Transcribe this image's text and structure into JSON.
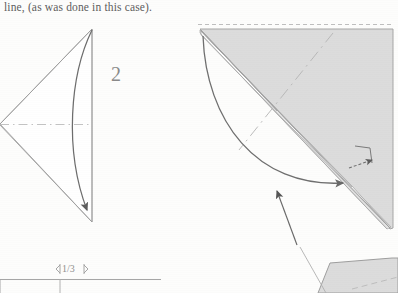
{
  "page": {
    "width": 398,
    "height": 293,
    "background_color": "#fdfdfc",
    "kind": "scanned-origami-instruction-page"
  },
  "caption": {
    "text": "line, (as was done in this case)."
  },
  "step": {
    "number": "2"
  },
  "dimension": {
    "label": "1/3"
  },
  "colors": {
    "paper_fill": "#dcdcdc",
    "paper_fill_light": "#e6e6e6",
    "line_stroke": "#9a9a9a",
    "edge_stroke": "#8d8d8d",
    "arrow_stroke": "#5a5a5a",
    "dash_stroke": "#b0b0b0",
    "text_color": "#5e5e5e",
    "white_flap": "#ffffff"
  },
  "figures": [
    {
      "name": "left-figure",
      "title": "kite triangle pointing left with valley crease and fold arrow",
      "vertices": {
        "apex_left": [
          0,
          124
        ],
        "top_right": [
          92,
          29
        ],
        "bottom_right": [
          92,
          222
        ]
      },
      "horizontal_crease": {
        "from": [
          0,
          124
        ],
        "to": [
          92,
          124
        ],
        "style": "dash-dot"
      },
      "fold_arrow": {
        "from": [
          92,
          30
        ],
        "to": [
          89,
          214
        ],
        "style": "curved",
        "arrowhead": "at-end"
      }
    },
    {
      "name": "right-figure",
      "title": "large folded triangle with dashed reference edge, crease line and fold-over arrows",
      "top_dashed_edge": {
        "from": [
          198,
          24
        ],
        "to": [
          392,
          24
        ]
      },
      "corner": [
        200,
        29
      ],
      "right_edge_x": 393,
      "bottom_point": [
        390,
        228
      ],
      "fold_arrow_curved": {
        "from": [
          203,
          36
        ],
        "to": [
          347,
          185
        ],
        "arrowhead": "at-end"
      },
      "small_flap_arrow": {
        "from": [
          352,
          175
        ],
        "to": [
          378,
          157
        ],
        "arrowhead": "at-end"
      },
      "pointer_arrow": {
        "from": [
          296,
          243
        ],
        "to": [
          277,
          192
        ],
        "arrowhead": "at-end"
      }
    },
    {
      "name": "bottom-right-partial-figure",
      "title": "partially visible next-step shape cut off by page edge",
      "points": "320,293 330,262 392,258 398,258 398,293"
    },
    {
      "name": "bottom-left-measure",
      "title": "one third width dimension tick marks and measured bar",
      "bar": {
        "from": [
          0,
          280
        ],
        "to": [
          160,
          280
        ]
      },
      "ticks": [
        60,
        82
      ]
    }
  ],
  "icons": {
    "fold_arrowhead": "solid-triangle-arrowhead",
    "dimension_tick": "dimension-tick-mark"
  }
}
